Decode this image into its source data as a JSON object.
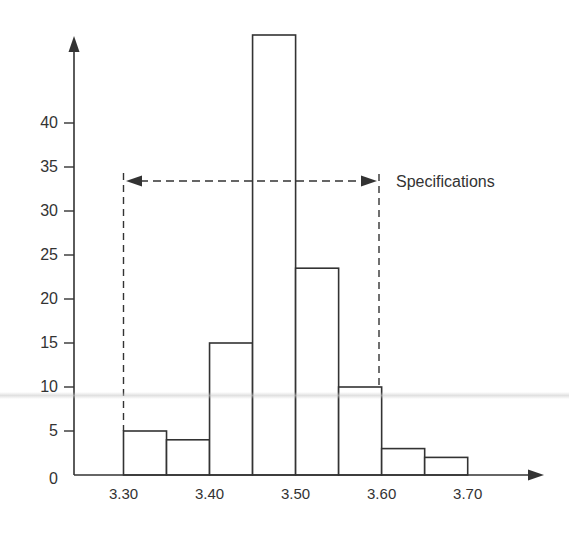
{
  "chart_data": {
    "type": "bar",
    "subtype": "histogram",
    "title": "",
    "xlabel": "",
    "ylabel": "",
    "bin_edges": [
      3.3,
      3.35,
      3.4,
      3.45,
      3.5,
      3.55,
      3.6,
      3.65,
      3.7
    ],
    "categories": [
      "3.30-3.35",
      "3.35-3.40",
      "3.40-3.45",
      "3.45-3.50",
      "3.50-3.55",
      "3.55-3.60",
      "3.60-3.65",
      "3.65-3.70"
    ],
    "values": [
      5,
      4,
      15,
      50,
      23.5,
      10,
      3,
      2
    ],
    "x_tick_labels": [
      "3.30",
      "3.40",
      "3.50",
      "3.60",
      "3.70"
    ],
    "x_ticks": [
      3.3,
      3.4,
      3.5,
      3.6,
      3.7
    ],
    "y_tick_labels": [
      "0",
      "5",
      "10",
      "15",
      "20",
      "25",
      "30",
      "35",
      "40"
    ],
    "y_ticks": [
      0,
      5,
      10,
      15,
      20,
      25,
      30,
      35,
      40
    ],
    "ylim": [
      0,
      50
    ],
    "xlim": [
      3.21,
      3.81
    ],
    "grid": false,
    "legend": null,
    "annotations": [
      {
        "type": "double-arrow-dashed",
        "label": "Specifications",
        "from_x": 3.3,
        "to_x": 3.6,
        "y": 33.5,
        "with_dashed_verticals": true
      }
    ]
  },
  "annotation": {
    "spec_label": "Specifications"
  },
  "colors": {
    "stroke": "#333333",
    "bar_fill": "#ffffff",
    "background": "#ffffff"
  }
}
